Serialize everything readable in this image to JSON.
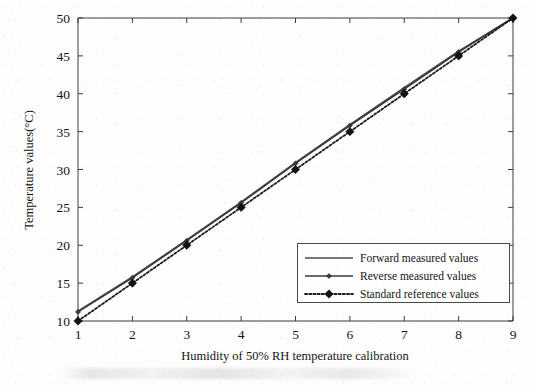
{
  "chart_data": {
    "type": "line",
    "title": "",
    "xlabel": "Humidity of 50% RH temperature calibration",
    "ylabel": "Temperature values(°C)",
    "x": [
      1,
      2,
      3,
      4,
      5,
      6,
      7,
      8,
      9
    ],
    "xlim": [
      1,
      9
    ],
    "ylim": [
      10,
      50
    ],
    "xticks": [
      1,
      2,
      3,
      4,
      5,
      6,
      7,
      8,
      9
    ],
    "xtick_labels": [
      "1",
      "2",
      "3",
      "4",
      "5",
      "6",
      "7",
      "8",
      "9"
    ],
    "yticks": [
      10,
      15,
      20,
      25,
      30,
      35,
      40,
      45,
      50
    ],
    "ytick_labels": [
      "10",
      "15",
      "20",
      "25",
      "30",
      "35",
      "40",
      "45",
      "50"
    ],
    "grid": false,
    "legend_position": "lower right",
    "series": [
      {
        "name": "Forward measured values",
        "style": "solid",
        "marker": "none",
        "color": "#4a4a4a",
        "values": [
          11.3,
          15.8,
          20.7,
          25.7,
          30.9,
          35.9,
          40.8,
          45.6,
          50.0
        ]
      },
      {
        "name": "Reverse measured values",
        "style": "solid",
        "marker": "diamond-small",
        "color": "#3a3a3a",
        "values": [
          11.2,
          15.7,
          20.6,
          25.6,
          30.8,
          35.8,
          40.6,
          45.5,
          50.0
        ]
      },
      {
        "name": "Standard reference values",
        "style": "dotted",
        "marker": "diamond-filled",
        "color": "#1c1c1c",
        "values": [
          10.0,
          15.0,
          20.0,
          25.0,
          30.0,
          35.0,
          40.0,
          45.0,
          50.0
        ]
      }
    ]
  },
  "legend": {
    "entries": [
      "Forward measured values",
      "Reverse measured values",
      "Standard reference values"
    ]
  },
  "axes": {
    "x_title": "Humidity of 50% RH temperature calibration",
    "y_title": "Temperature values(°C)"
  },
  "colors": {
    "background": "#fdfdfd",
    "axis": "#3c3c3c",
    "ink": "#1a1a1a"
  }
}
